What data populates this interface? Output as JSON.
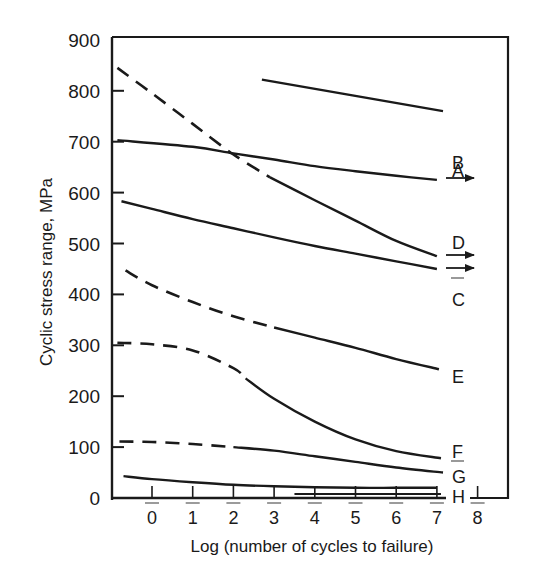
{
  "chart_data": {
    "type": "line",
    "title": "",
    "xlabel": "Log (number of cycles to failure)",
    "ylabel": "Cyclic stress range, MPa",
    "xlim": [
      -1,
      8.5
    ],
    "ylim": [
      0,
      900
    ],
    "x_ticks": [
      0,
      1,
      2,
      3,
      4,
      5,
      6,
      7,
      8
    ],
    "y_ticks": [
      0,
      100,
      200,
      300,
      400,
      500,
      600,
      700,
      800,
      900
    ],
    "grid": false,
    "legend": "inline labels at right end of each curve",
    "series": [
      {
        "name": "A",
        "style": "solid",
        "arrow": false,
        "points": [
          [
            2.7,
            822
          ],
          [
            7.15,
            760
          ]
        ]
      },
      {
        "name": "B",
        "style": "solid",
        "arrow": true,
        "points": [
          [
            -0.85,
            703
          ],
          [
            1,
            690
          ],
          [
            2,
            677
          ],
          [
            3,
            665
          ],
          [
            4,
            652
          ],
          [
            5,
            642
          ],
          [
            6,
            633
          ],
          [
            7,
            625
          ]
        ]
      },
      {
        "name": "D",
        "style": "dashed-then-solid",
        "arrow": true,
        "solid_from_x": 2.9,
        "points": [
          [
            -0.85,
            845
          ],
          [
            0,
            795
          ],
          [
            1,
            735
          ],
          [
            2,
            675
          ],
          [
            2.9,
            630
          ],
          [
            4,
            585
          ],
          [
            5,
            545
          ],
          [
            6,
            505
          ],
          [
            7,
            475
          ]
        ]
      },
      {
        "name": "C",
        "style": "solid",
        "arrow": true,
        "points": [
          [
            -0.75,
            583
          ],
          [
            0,
            568
          ],
          [
            1,
            548
          ],
          [
            2,
            530
          ],
          [
            3,
            512
          ],
          [
            4,
            495
          ],
          [
            5,
            480
          ],
          [
            6,
            465
          ],
          [
            7,
            450
          ]
        ]
      },
      {
        "name": "E",
        "style": "dashed-then-solid",
        "arrow": false,
        "solid_from_x": 3.0,
        "points": [
          [
            -0.65,
            447
          ],
          [
            0,
            418
          ],
          [
            1,
            385
          ],
          [
            2,
            357
          ],
          [
            3,
            335
          ],
          [
            4,
            315
          ],
          [
            5,
            295
          ],
          [
            6,
            273
          ],
          [
            7.05,
            253
          ]
        ]
      },
      {
        "name": "F",
        "style": "dashed-then-solid",
        "arrow": false,
        "solid_from_x": 2.3,
        "points": [
          [
            -0.85,
            305
          ],
          [
            0,
            302
          ],
          [
            1,
            290
          ],
          [
            2,
            255
          ],
          [
            2.3,
            235
          ],
          [
            3,
            195
          ],
          [
            4,
            150
          ],
          [
            5,
            115
          ],
          [
            6,
            92
          ],
          [
            7.1,
            78
          ]
        ]
      },
      {
        "name": "G",
        "style": "dashed-then-solid",
        "arrow": false,
        "solid_from_x": 2.0,
        "points": [
          [
            -0.8,
            111
          ],
          [
            0,
            110
          ],
          [
            1,
            106
          ],
          [
            2,
            100
          ],
          [
            3,
            93
          ],
          [
            4,
            82
          ],
          [
            5,
            71
          ],
          [
            6,
            60
          ],
          [
            7.15,
            50
          ]
        ]
      },
      {
        "name": "H",
        "style": "solid",
        "arrow": false,
        "points": [
          [
            -0.7,
            43
          ],
          [
            0,
            37
          ],
          [
            1,
            31
          ],
          [
            2,
            26
          ],
          [
            3,
            23
          ],
          [
            4,
            21
          ],
          [
            5,
            20
          ],
          [
            6,
            20
          ],
          [
            7,
            20
          ]
        ]
      }
    ]
  },
  "labels": {
    "y_axis_title": "Cyclic stress range, MPa",
    "x_axis_title": "Log (number of cycles to failure)",
    "y_tick_labels": [
      "900",
      "800",
      "700",
      "600",
      "500",
      "400",
      "300",
      "200",
      "100",
      "0"
    ],
    "x_tick_labels": [
      "0",
      "1",
      "2",
      "3",
      "4",
      "5",
      "6",
      "7",
      "8"
    ],
    "curve_labels": [
      "A",
      "B",
      "D",
      "C",
      "E",
      "F",
      "G",
      "H"
    ]
  },
  "colors": {
    "ink": "#1a1a1a",
    "background": "#ffffff"
  }
}
